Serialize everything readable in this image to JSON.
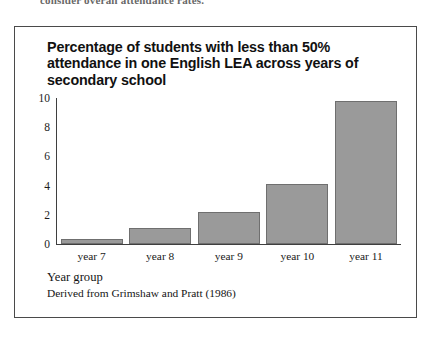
{
  "page": {
    "cutoff_text_top": "consider overall attendance rates."
  },
  "figure": {
    "title": "Percentage of students with less than 50% attendance in one English LEA across years of secondary school",
    "x_axis_title": "Year group",
    "source_note": "Derived from Grimshaw and Pratt (1986)",
    "bar_fill_color": "#9a9a9a",
    "bar_border_color": "#6f6f6f",
    "frame_color": "#4a4a4a",
    "axis_color": "#3f3f3f"
  },
  "chart_data": {
    "type": "bar",
    "title": "Percentage of students with less than 50% attendance in one English LEA across years of secondary school",
    "xlabel": "Year group",
    "ylabel": "",
    "categories": [
      "year 7",
      "year 8",
      "year 9",
      "year 10",
      "year 11"
    ],
    "values": [
      0.35,
      1.1,
      2.2,
      4.1,
      9.8
    ],
    "ylim": [
      0,
      10
    ],
    "yticks": [
      0,
      2,
      4,
      6,
      8,
      10
    ],
    "ytick_labels": [
      "0",
      "2",
      "4",
      "6",
      "8",
      "10"
    ],
    "grid": false,
    "legend": null,
    "annotation": "Derived from Grimshaw and Pratt (1986)"
  }
}
